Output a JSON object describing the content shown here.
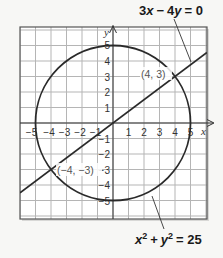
{
  "figure": {
    "line_equation": {
      "a": "3",
      "x": "x",
      "op": "−",
      "b": "4",
      "y": "y",
      "eq": "= 0"
    },
    "circle_equation": {
      "x": "x",
      "x_exp": "2",
      "plus": "+",
      "y": "y",
      "y_exp": "2",
      "eq": "= 25"
    },
    "axis_labels": {
      "x": "x",
      "y": "y"
    },
    "x_ticks": [
      "−5",
      "−4",
      "−3",
      "−2",
      "−1",
      "1",
      "2",
      "3",
      "4",
      "5"
    ],
    "y_ticks": [
      "5",
      "4",
      "3",
      "2",
      "1",
      "−1",
      "−2",
      "−3",
      "−4",
      "−5"
    ],
    "points": [
      {
        "label_open": "(",
        "x": "4",
        "sep": ", ",
        "y": "3",
        "label_close": ")"
      },
      {
        "label_open": "(",
        "x": "−4",
        "sep": ", ",
        "y": "−3",
        "label_close": ")"
      }
    ],
    "colors": {
      "grid": "#b5b5b5",
      "curve": "#2a2a2a",
      "axis": "#333333",
      "background": "#f7f7f5",
      "plot_bg": "#ffffff"
    }
  },
  "chart_data": {
    "type": "line",
    "title": "",
    "xlabel": "x",
    "ylabel": "y",
    "xlim": [
      -6,
      6
    ],
    "ylim": [
      -6,
      6
    ],
    "grid": true,
    "series": [
      {
        "name": "3x − 4y = 0",
        "kind": "line",
        "slope": 0.75,
        "intercept": 0
      },
      {
        "name": "x² + y² = 25",
        "kind": "circle",
        "center": [
          0,
          0
        ],
        "radius": 5
      }
    ],
    "annotations": [
      {
        "text": "(4, 3)",
        "x": 4,
        "y": 3
      },
      {
        "text": "(−4, −3)",
        "x": -4,
        "y": -3
      }
    ]
  }
}
